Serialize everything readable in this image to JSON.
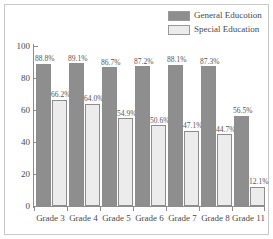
{
  "chart_data": {
    "type": "bar",
    "title": "",
    "xlabel": "",
    "ylabel": "",
    "ylim": [
      0,
      100
    ],
    "yticks": [
      0,
      20,
      40,
      60,
      80,
      100
    ],
    "grid": false,
    "legend_position": "top-right",
    "categories": [
      "Grade 3",
      "Grade 4",
      "Grade 5",
      "Grade 6",
      "Grade 7",
      "Grade 8",
      "Grade 11"
    ],
    "series": [
      {
        "name": "General Educotion",
        "color": "#8e8e8e",
        "values": [
          88.8,
          89.1,
          86.7,
          87.2,
          88.1,
          87.3,
          56.5
        ],
        "labels": [
          "88.8%",
          "89.1%",
          "86.7%",
          "87.2%",
          "88.1%",
          "87.3%",
          "56.5%"
        ]
      },
      {
        "name": "Special Education",
        "color": "#ececec",
        "values": [
          66.2,
          64.0,
          54.9,
          50.6,
          47.1,
          44.7,
          12.1
        ],
        "labels": [
          "66.2%",
          "64.0%",
          "54.9%",
          "50.6%",
          "47.1%",
          "44.7%",
          "12.1%"
        ]
      }
    ]
  },
  "axis": {
    "y_tick_labels": [
      "100",
      "80",
      "60",
      "40",
      "20",
      "0"
    ]
  },
  "legend": {
    "items": [
      {
        "label": "General Educotion",
        "color": "#8e8e8e"
      },
      {
        "label": "Special Education",
        "color": "#ececec"
      }
    ]
  }
}
